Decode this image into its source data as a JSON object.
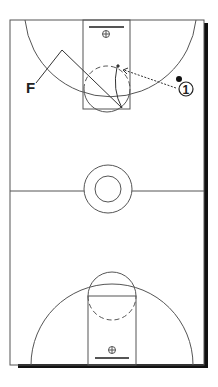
{
  "diagram": {
    "colors": {
      "line": "#555555",
      "shadow": "#111111",
      "text": "#222222",
      "background": "#ffffff"
    },
    "players": [
      {
        "id": "player-1",
        "label": "1",
        "position": "right wing"
      }
    ],
    "markers": [
      {
        "id": "marker-f",
        "label": "F",
        "position": "left of top key"
      }
    ],
    "actions": [
      {
        "type": "pass",
        "style": "dashed-arrow",
        "from": "player-1",
        "to": "free-throw circle"
      },
      {
        "type": "cut",
        "style": "solid-line",
        "from": "marker-f",
        "to": "free-throw circle"
      }
    ],
    "court": {
      "halves": 2,
      "features": [
        "center circle",
        "half-court line",
        "keys",
        "free-throw circles",
        "three-point arcs",
        "backboards",
        "hoops"
      ]
    }
  }
}
